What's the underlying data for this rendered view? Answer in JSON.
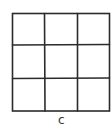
{
  "diagram": {
    "type": "grid",
    "rows": 3,
    "columns": 3,
    "label": "c",
    "line_color": "#2b2b2b",
    "background": "#ffffff"
  }
}
